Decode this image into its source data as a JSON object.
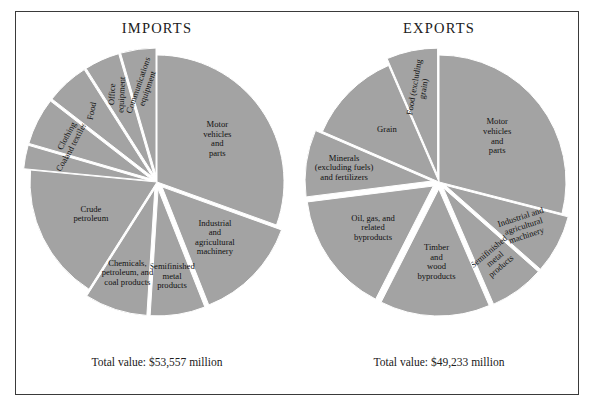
{
  "figure": {
    "background": "#ffffff",
    "frame_color": "#3a3a3a",
    "slice_fill": "#a3a3a3",
    "slice_edge": "#ffffff"
  },
  "panels": [
    {
      "key": "imports",
      "title": "IMPORTS",
      "total_label": "Total value: $53,557 million"
    },
    {
      "key": "exports",
      "title": "EXPORTS",
      "total_label": "Total value: $49,233 million"
    }
  ],
  "chart_data": [
    {
      "type": "pie",
      "title": "IMPORTS",
      "total_label": "Total value: $53,557 million",
      "total_value": 53557,
      "units": "million dollars",
      "start_angle_deg": -90,
      "direction": "counterclockwise",
      "legend": "none (labels placed on slices)",
      "categories": [
        "Motor vehicles and parts",
        "Industrial and agricultural machinery",
        "Semifinished metal products",
        "Chemicals, petroleum, and coal products",
        "Crude petroleum",
        "Coal",
        "Clothing and textiles",
        "Food",
        "Office equipment",
        "Communications equipment"
      ],
      "values": [
        30.5,
        13.5,
        7.0,
        8.0,
        17.5,
        3.0,
        6.0,
        5.5,
        4.5,
        4.5
      ],
      "value_units": "percent of total",
      "slices": [
        {
          "label": "Motor\nvehicles\nand\nparts",
          "percent": 30.5,
          "exploded": false,
          "label_rotation": 0,
          "label_anchor": "middle"
        },
        {
          "label": "Industrial\nand\nagricultural\nmachinery",
          "percent": 13.5,
          "exploded": true,
          "label_rotation": 0,
          "label_anchor": "middle"
        },
        {
          "label": "Semifinished\nmetal\nproducts",
          "percent": 7.0,
          "exploded": true,
          "label_rotation": 0,
          "label_anchor": "middle"
        },
        {
          "label": "Chemicals,\npetroleum, and\ncoal products",
          "percent": 8.0,
          "exploded": true,
          "label_rotation": 0,
          "label_anchor": "middle"
        },
        {
          "label": "Crude\npetroleum",
          "percent": 17.5,
          "exploded": false,
          "label_rotation": 0,
          "label_anchor": "middle"
        },
        {
          "label": "Coal",
          "percent": 3.0,
          "exploded": true,
          "label_rotation": -60,
          "label_anchor": "middle"
        },
        {
          "label": "Clothing\nand textiles",
          "percent": 6.0,
          "exploded": true,
          "label_rotation": -62,
          "label_anchor": "middle"
        },
        {
          "label": "Food",
          "percent": 5.5,
          "exploded": true,
          "label_rotation": -78,
          "label_anchor": "middle"
        },
        {
          "label": "Office\nequipment",
          "percent": 4.5,
          "exploded": true,
          "label_rotation": -87,
          "label_anchor": "middle"
        },
        {
          "label": "Communications\nequipment",
          "percent": 4.5,
          "exploded": true,
          "label_rotation": -71,
          "label_anchor": "middle"
        }
      ]
    },
    {
      "type": "pie",
      "title": "EXPORTS",
      "total_label": "Total value: $49,233 million",
      "total_value": 49233,
      "units": "million dollars",
      "start_angle_deg": -90,
      "direction": "counterclockwise",
      "legend": "none (labels placed on slices)",
      "categories": [
        "Motor vehicles and parts",
        "Industrial and agricultural machinery",
        "Semifinished metal products",
        "Timber and wood byproducts",
        "Oil, gas, and related byproducts",
        "Minerals (excluding fuels) and fertilizers",
        "Grain",
        "Food (excluding grain)"
      ],
      "values": [
        29.0,
        7.5,
        7.0,
        14.0,
        15.5,
        8.5,
        12.0,
        6.5
      ],
      "value_units": "percent of total",
      "slices": [
        {
          "label": "Motor\nvehicles\nand\nparts",
          "percent": 29.0,
          "exploded": false,
          "label_rotation": 0,
          "label_anchor": "middle"
        },
        {
          "label": "Industrial and\nagricultural\nmachinery",
          "percent": 7.5,
          "exploded": true,
          "label_rotation": -18,
          "label_anchor": "middle"
        },
        {
          "label": "Semifinished\nmetal\nproducts",
          "percent": 7.0,
          "exploded": true,
          "label_rotation": -40,
          "label_anchor": "middle"
        },
        {
          "label": "Timber\nand\nwood\nbyproducts",
          "percent": 14.0,
          "exploded": true,
          "label_rotation": 0,
          "label_anchor": "middle"
        },
        {
          "label": "Oil, gas, and\nrelated\nbyproducts",
          "percent": 15.5,
          "exploded": true,
          "label_rotation": 0,
          "label_anchor": "middle"
        },
        {
          "label": "Minerals\n(excluding fuels)\nand fertilizers",
          "percent": 8.5,
          "exploded": true,
          "label_rotation": 0,
          "label_anchor": "middle"
        },
        {
          "label": "Grain",
          "percent": 12.0,
          "exploded": false,
          "label_rotation": 0,
          "label_anchor": "middle"
        },
        {
          "label": "Food (excluding\ngrain)",
          "percent": 6.5,
          "exploded": true,
          "label_rotation": -80,
          "label_anchor": "middle"
        }
      ]
    }
  ]
}
